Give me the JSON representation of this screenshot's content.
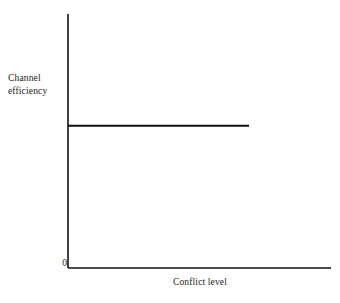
{
  "chart_data": {
    "type": "line",
    "title": "",
    "subtitle": "",
    "xlabel": "Conflict level",
    "ylabel": "Channel efficiency",
    "ylabel_lines": "Channel\nefficiency",
    "origin_label": "0",
    "grid": false,
    "legend": "none",
    "axis_ticks": [
      "0"
    ],
    "xlim": [
      0,
      1
    ],
    "ylim": [
      0,
      1
    ],
    "series": [
      {
        "name": "Channel efficiency",
        "color": "#111111",
        "x": [
          0,
          0.17,
          0.34,
          0.52,
          0.69,
          0.86,
          1.0
        ],
        "values": [
          0.56,
          0.56,
          0.56,
          0.56,
          0.56,
          0.56,
          0.56
        ],
        "description": "Constant horizontal line: channel efficiency does not change as conflict level increases"
      }
    ],
    "geometry": {
      "x_axis_start_px": 68,
      "x_axis_end_px": 331,
      "y_axis_top_px": 14,
      "y_axis_bottom_px": 268,
      "series_y_px": 126,
      "series_x_end_px": 249
    }
  },
  "colors": {
    "axis": "#111111",
    "series": "#111111",
    "background": "#ffffff"
  }
}
